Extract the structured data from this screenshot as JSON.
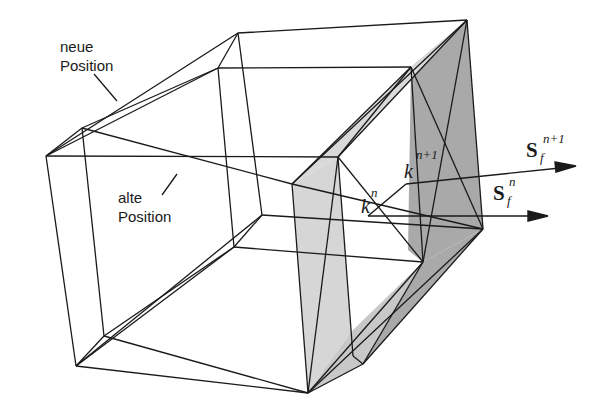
{
  "figure": {
    "labels": {
      "neue_line1": "neue",
      "neue_line2": "Position",
      "alte_line1": "alte",
      "alte_line2": "Position",
      "k_n_base": "k",
      "k_n_sup": "n",
      "k_n1_base": "k",
      "k_n1_sup": "n+1",
      "s_n_base": "S",
      "s_n_sub": "f",
      "s_n_sup": "n",
      "s_n1_base": "S",
      "s_n1_sub": "f",
      "s_n1_sup": "n+1"
    },
    "colors": {
      "line": "#1a1a1a",
      "shade_light": "#d6d6d6",
      "shade_dark": "#a9a9a9",
      "background": "#ffffff"
    }
  }
}
